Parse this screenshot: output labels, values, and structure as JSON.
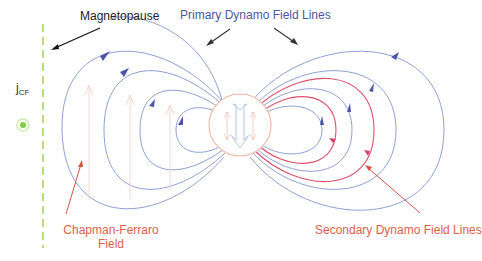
{
  "labels": {
    "magnetopause": "Magnetopause",
    "primary_dynamo": "Primary Dynamo Field Lines",
    "jcf_main": "j",
    "jcf_sub": "CF",
    "chapman_line1": "Chapman-Ferraro",
    "chapman_line2": "Field",
    "secondary_dynamo": "Secondary Dynamo Field Lines"
  },
  "colors": {
    "primary_lines": "#8f9fd6",
    "primary_arrows": "#4b55a8",
    "secondary_lines": "#e0506a",
    "sphere_outline": "#f2b8a8",
    "magnetopause": "#b8e07a",
    "current_dot": "#7fd040",
    "label_red": "#e0604a",
    "label_blue": "#4a5aa0"
  },
  "icons": {
    "current_out_of_page": "circle-dot-icon",
    "dipole_arrow": "down-arrow-icon"
  }
}
